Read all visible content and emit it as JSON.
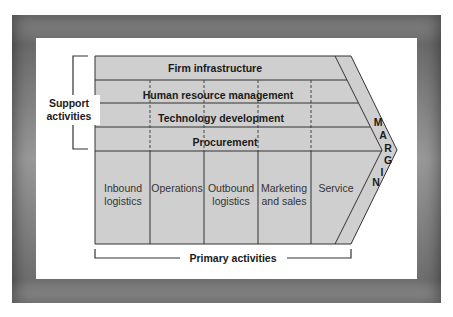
{
  "diagram": {
    "support_label": [
      "Support",
      "activities"
    ],
    "primary_label": "Primary activities",
    "support_rows": [
      {
        "label": "Firm infrastructure"
      },
      {
        "label": "Human resource management"
      },
      {
        "label": "Technology development"
      },
      {
        "label": "Procurement"
      }
    ],
    "primary_columns": [
      {
        "label": [
          "Inbound",
          "logistics"
        ]
      },
      {
        "label": [
          "Operations"
        ]
      },
      {
        "label": [
          "Outbound",
          "logistics"
        ]
      },
      {
        "label": [
          "Marketing",
          "and sales"
        ]
      },
      {
        "label": [
          "Service"
        ]
      }
    ],
    "margin_letters": [
      "M",
      "A",
      "R",
      "G",
      "I",
      "N"
    ],
    "colors": {
      "box_fill": "#cfcfcf",
      "line": "#333333",
      "frame": "#7a7a7a"
    }
  }
}
